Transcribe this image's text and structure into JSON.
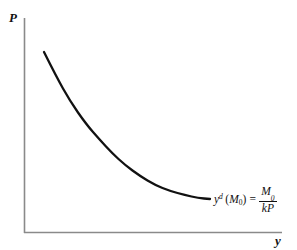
{
  "figure": {
    "background_color": "#ffffff",
    "axis_color": "#8a8a8a",
    "curve_color": "#111111",
    "text_color": "#111111",
    "width": 297,
    "height": 250
  },
  "axes": {
    "vertical": {
      "label": "P",
      "name": "price-level",
      "x": 24,
      "y_top": 18,
      "y_bottom": 233
    },
    "horizontal": {
      "label": "y",
      "name": "real-output",
      "y": 233,
      "x_left": 24,
      "x_right": 282
    }
  },
  "annotation": {
    "variable": "y",
    "superscript": "d",
    "open_paren": "(",
    "arg": "M",
    "arg_subscript": "0",
    "close_paren": ")",
    "equals": "=",
    "numerator": "M",
    "numerator_subscript": "0",
    "denominator": "kP",
    "full_text": "y^d (M0) = M0 / kP"
  },
  "chart_data": {
    "type": "line",
    "title": "",
    "xlabel": "y",
    "ylabel": "P",
    "grid": false,
    "legend": null,
    "axis_arrows": false,
    "series": [
      {
        "name": "y^d (M0) = M0 / kP",
        "description": "Aggregate demand / money demand curve, rectangular hyperbola P = M0/(k*y)",
        "points_px": [
          [
            44,
            52
          ],
          [
            56,
            76
          ],
          [
            70,
            101
          ],
          [
            86,
            124
          ],
          [
            100,
            140
          ],
          [
            112,
            153
          ],
          [
            125,
            165
          ],
          [
            140,
            176
          ],
          [
            155,
            185
          ],
          [
            170,
            191
          ],
          [
            185,
            195
          ],
          [
            198,
            198
          ],
          [
            210,
            199
          ]
        ]
      }
    ],
    "xlim": [
      24,
      282
    ],
    "ylim": [
      233,
      18
    ]
  }
}
